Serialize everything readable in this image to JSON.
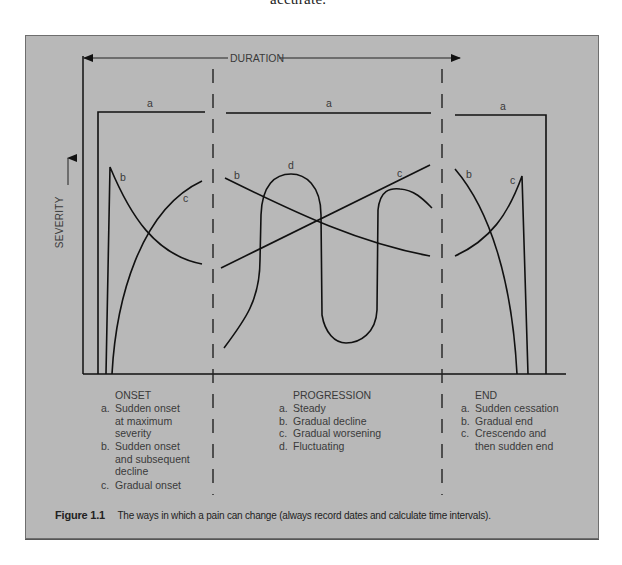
{
  "page": {
    "top_text": "accurate."
  },
  "figure": {
    "duration_label": "DURATION",
    "severity_label": "SEVERITY",
    "curve_labels": {
      "onset": {
        "a": "a",
        "b": "b",
        "c": "c"
      },
      "progression": {
        "a": "a",
        "b": "b",
        "c": "c",
        "d": "d"
      },
      "end": {
        "a": "a",
        "b": "b",
        "c": "c"
      }
    },
    "sections": [
      {
        "title": "ONSET",
        "items": [
          {
            "key": "a.",
            "text_lines": [
              "Sudden onset",
              "at maximum",
              "severity"
            ]
          },
          {
            "key": "b.",
            "text_lines": [
              "Sudden onset",
              "and subsequent",
              "decline"
            ]
          },
          {
            "key": "c.",
            "text_lines": [
              "Gradual onset"
            ]
          }
        ]
      },
      {
        "title": "PROGRESSION",
        "items": [
          {
            "key": "a.",
            "text_lines": [
              "Steady"
            ]
          },
          {
            "key": "b.",
            "text_lines": [
              "Gradual decline"
            ]
          },
          {
            "key": "c.",
            "text_lines": [
              "Gradual worsening"
            ]
          },
          {
            "key": "d.",
            "text_lines": [
              "Fluctuating"
            ]
          }
        ]
      },
      {
        "title": "END",
        "items": [
          {
            "key": "a.",
            "text_lines": [
              "Sudden cessation"
            ]
          },
          {
            "key": "b.",
            "text_lines": [
              "Gradual end"
            ]
          },
          {
            "key": "c.",
            "text_lines": [
              "Crescendo and",
              "then sudden end"
            ]
          }
        ]
      }
    ],
    "caption": {
      "figure_number": "Figure 1.1",
      "text": "The ways in which a pain can change (always record dates and calculate time intervals)."
    },
    "colors": {
      "panel_background": "#b8b8b8",
      "line": "#111111",
      "label_text": "#3a3a3a"
    }
  }
}
